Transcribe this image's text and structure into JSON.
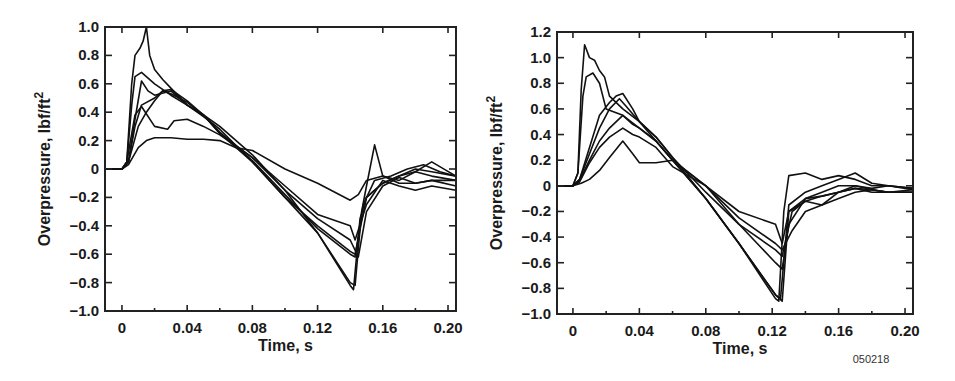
{
  "figure_id": "050218",
  "chart_data": [
    {
      "type": "line",
      "title": "",
      "xlabel": "Time, s",
      "ylabel": "Overpressure, lbf/ft",
      "ylabel_superscript": "2",
      "xlim": [
        -0.0104,
        0.2049
      ],
      "ylim": [
        -1.0,
        1.0
      ],
      "xticks": [
        0,
        0.04,
        0.08,
        0.12,
        0.16,
        0.2
      ],
      "xtick_labels": [
        "0",
        "0.04",
        "0.08",
        "0.12",
        "0.16",
        "0.20"
      ],
      "yticks": [
        -1.0,
        -0.8,
        -0.6,
        -0.4,
        -0.2,
        0,
        0.2,
        0.4,
        0.6,
        0.8,
        1.0
      ],
      "ytick_labels": [
        "−1.0",
        "−0.8",
        "−0.6",
        "−0.4",
        "−0.2",
        "0",
        "0.2",
        "0.4",
        "0.6",
        "0.8",
        "1.0"
      ],
      "grid": false,
      "legend": null,
      "color": "#111111",
      "series": [
        {
          "name": "trace-1",
          "x": [
            -0.0104,
            0.0,
            0.003,
            0.006,
            0.008,
            0.011,
            0.013,
            0.015,
            0.017,
            0.02,
            0.025,
            0.03,
            0.04,
            0.05,
            0.06,
            0.08,
            0.1,
            0.12,
            0.14,
            0.142,
            0.146,
            0.15,
            0.16,
            0.17,
            0.18,
            0.19,
            0.2049
          ],
          "y": [
            0,
            0,
            0.05,
            0.6,
            0.8,
            0.85,
            0.9,
            1.0,
            0.8,
            0.7,
            0.63,
            0.57,
            0.45,
            0.37,
            0.28,
            0.05,
            -0.2,
            -0.45,
            -0.82,
            -0.85,
            -0.35,
            -0.2,
            -0.1,
            -0.05,
            0.0,
            -0.02,
            -0.05
          ]
        },
        {
          "name": "trace-2",
          "x": [
            -0.0104,
            0.0,
            0.003,
            0.006,
            0.008,
            0.012,
            0.02,
            0.03,
            0.04,
            0.05,
            0.06,
            0.08,
            0.1,
            0.12,
            0.14,
            0.143,
            0.147,
            0.15,
            0.155,
            0.16,
            0.17,
            0.18,
            0.19,
            0.2049
          ],
          "y": [
            0,
            0,
            0.05,
            0.45,
            0.65,
            0.68,
            0.6,
            0.52,
            0.45,
            0.38,
            0.3,
            0.1,
            -0.15,
            -0.45,
            -0.8,
            -0.82,
            -0.3,
            -0.12,
            0.17,
            -0.05,
            -0.08,
            -0.02,
            0.05,
            -0.05
          ]
        },
        {
          "name": "trace-3",
          "x": [
            -0.0104,
            0.0,
            0.004,
            0.008,
            0.012,
            0.016,
            0.02,
            0.03,
            0.04,
            0.05,
            0.06,
            0.08,
            0.1,
            0.12,
            0.14,
            0.143,
            0.148,
            0.155,
            0.165,
            0.175,
            0.185,
            0.195,
            0.2049
          ],
          "y": [
            0,
            0,
            0.05,
            0.35,
            0.62,
            0.55,
            0.52,
            0.55,
            0.45,
            0.38,
            0.26,
            0.06,
            -0.18,
            -0.42,
            -0.6,
            -0.62,
            -0.25,
            -0.08,
            -0.05,
            0.0,
            0.03,
            -0.02,
            -0.05
          ]
        },
        {
          "name": "trace-4",
          "x": [
            -0.0104,
            0.0,
            0.004,
            0.008,
            0.012,
            0.02,
            0.025,
            0.03,
            0.04,
            0.05,
            0.06,
            0.08,
            0.1,
            0.12,
            0.14,
            0.143,
            0.15,
            0.16,
            0.17,
            0.18,
            0.19,
            0.2049
          ],
          "y": [
            0,
            0,
            0.05,
            0.3,
            0.45,
            0.5,
            0.55,
            0.53,
            0.47,
            0.38,
            0.25,
            0.05,
            -0.2,
            -0.4,
            -0.58,
            -0.6,
            -0.2,
            -0.1,
            -0.05,
            -0.02,
            -0.05,
            -0.08
          ]
        },
        {
          "name": "trace-5",
          "x": [
            -0.0104,
            0.0,
            0.004,
            0.01,
            0.015,
            0.02,
            0.025,
            0.03,
            0.04,
            0.05,
            0.06,
            0.08,
            0.1,
            0.12,
            0.14,
            0.145,
            0.15,
            0.16,
            0.17,
            0.18,
            0.19,
            0.2049
          ],
          "y": [
            0,
            0,
            0.05,
            0.3,
            0.4,
            0.48,
            0.55,
            0.56,
            0.48,
            0.38,
            0.25,
            0.08,
            -0.15,
            -0.35,
            -0.5,
            -0.62,
            -0.3,
            -0.12,
            -0.06,
            -0.1,
            -0.08,
            -0.12
          ]
        },
        {
          "name": "trace-6",
          "x": [
            -0.0104,
            0.0,
            0.003,
            0.008,
            0.012,
            0.02,
            0.028,
            0.032,
            0.04,
            0.05,
            0.06,
            0.08,
            0.1,
            0.12,
            0.14,
            0.143,
            0.15,
            0.16,
            0.17,
            0.18,
            0.19,
            0.2049
          ],
          "y": [
            0,
            0,
            0.05,
            0.38,
            0.44,
            0.3,
            0.28,
            0.34,
            0.35,
            0.3,
            0.24,
            0.08,
            -0.12,
            -0.32,
            -0.4,
            -0.5,
            -0.25,
            -0.08,
            -0.12,
            -0.15,
            -0.12,
            -0.15
          ]
        },
        {
          "name": "trace-7",
          "x": [
            -0.0104,
            0.0,
            0.004,
            0.01,
            0.015,
            0.02,
            0.03,
            0.04,
            0.05,
            0.06,
            0.07,
            0.08,
            0.1,
            0.12,
            0.14,
            0.145,
            0.15,
            0.16,
            0.17,
            0.18,
            0.19,
            0.2049
          ],
          "y": [
            0,
            0,
            0.03,
            0.15,
            0.2,
            0.22,
            0.22,
            0.21,
            0.21,
            0.2,
            0.15,
            0.13,
            0.0,
            -0.1,
            -0.22,
            -0.18,
            -0.08,
            -0.05,
            -0.1,
            -0.1,
            -0.08,
            -0.08
          ]
        }
      ]
    },
    {
      "type": "line",
      "title": "",
      "xlabel": "Time, s",
      "ylabel": "Overpressure, lbf/ft",
      "ylabel_superscript": "2",
      "xlim": [
        -0.0096,
        0.2048
      ],
      "ylim": [
        -1.0,
        1.2
      ],
      "xticks": [
        0,
        0.04,
        0.08,
        0.12,
        0.16,
        0.2
      ],
      "xtick_labels": [
        "0",
        "0.04",
        "0.08",
        "0.12",
        "0.16",
        "0.20"
      ],
      "yticks": [
        -1.0,
        -0.8,
        -0.6,
        -0.4,
        -0.2,
        0,
        0.2,
        0.4,
        0.6,
        0.8,
        1.0,
        1.2
      ],
      "ytick_labels": [
        "−1.0",
        "−0.8",
        "−0.6",
        "−0.4",
        "−0.2",
        "0",
        "0.2",
        "0.4",
        "0.6",
        "0.8",
        "1.0",
        "1.2"
      ],
      "grid": false,
      "legend": null,
      "color": "#111111",
      "series": [
        {
          "name": "trace-1",
          "x": [
            -0.0096,
            0.0,
            0.003,
            0.005,
            0.007,
            0.01,
            0.013,
            0.016,
            0.019,
            0.022,
            0.03,
            0.04,
            0.05,
            0.06,
            0.08,
            0.1,
            0.122,
            0.124,
            0.127,
            0.13,
            0.14,
            0.15,
            0.16,
            0.17,
            0.18,
            0.19,
            0.2048
          ],
          "y": [
            0,
            0,
            0.1,
            0.75,
            1.1,
            1.0,
            0.98,
            0.9,
            0.85,
            0.7,
            0.6,
            0.5,
            0.35,
            0.2,
            -0.1,
            -0.45,
            -0.88,
            -0.9,
            -0.2,
            0.08,
            0.1,
            0.05,
            0.08,
            0.05,
            0.0,
            0.0,
            -0.02
          ]
        },
        {
          "name": "trace-2",
          "x": [
            -0.0096,
            0.0,
            0.003,
            0.006,
            0.008,
            0.012,
            0.016,
            0.02,
            0.03,
            0.04,
            0.05,
            0.06,
            0.08,
            0.1,
            0.122,
            0.125,
            0.13,
            0.14,
            0.15,
            0.16,
            0.17,
            0.18,
            0.19,
            0.2048
          ],
          "y": [
            0,
            0,
            0.1,
            0.7,
            0.85,
            0.88,
            0.8,
            0.6,
            0.55,
            0.45,
            0.35,
            0.2,
            -0.1,
            -0.45,
            -0.85,
            -0.88,
            -0.15,
            -0.05,
            0.0,
            0.05,
            0.1,
            0.02,
            0.0,
            -0.02
          ]
        },
        {
          "name": "trace-3",
          "x": [
            -0.0096,
            0.0,
            0.004,
            0.01,
            0.016,
            0.022,
            0.026,
            0.03,
            0.036,
            0.04,
            0.05,
            0.06,
            0.08,
            0.1,
            0.122,
            0.126,
            0.13,
            0.14,
            0.15,
            0.16,
            0.17,
            0.18,
            0.19,
            0.2048
          ],
          "y": [
            0,
            0,
            0.05,
            0.3,
            0.55,
            0.65,
            0.7,
            0.72,
            0.6,
            0.5,
            0.38,
            0.22,
            -0.1,
            -0.45,
            -0.85,
            -0.9,
            -0.2,
            -0.1,
            -0.05,
            0.0,
            0.0,
            -0.02,
            0.0,
            -0.03
          ]
        },
        {
          "name": "trace-4",
          "x": [
            -0.0096,
            0.0,
            0.004,
            0.01,
            0.016,
            0.022,
            0.028,
            0.032,
            0.04,
            0.05,
            0.06,
            0.08,
            0.1,
            0.122,
            0.126,
            0.13,
            0.14,
            0.15,
            0.16,
            0.17,
            0.18,
            0.19,
            0.2048
          ],
          "y": [
            0,
            0,
            0.05,
            0.25,
            0.45,
            0.6,
            0.68,
            0.62,
            0.5,
            0.38,
            0.22,
            -0.05,
            -0.3,
            -0.6,
            -0.65,
            -0.3,
            -0.1,
            -0.08,
            -0.05,
            -0.02,
            -0.03,
            -0.05,
            -0.05
          ]
        },
        {
          "name": "trace-5",
          "x": [
            -0.0096,
            0.0,
            0.004,
            0.01,
            0.016,
            0.022,
            0.03,
            0.036,
            0.04,
            0.05,
            0.06,
            0.08,
            0.1,
            0.122,
            0.126,
            0.132,
            0.14,
            0.15,
            0.16,
            0.17,
            0.18,
            0.19,
            0.2048
          ],
          "y": [
            0,
            0,
            0.04,
            0.2,
            0.35,
            0.45,
            0.55,
            0.48,
            0.45,
            0.35,
            0.2,
            0.0,
            -0.3,
            -0.5,
            -0.55,
            -0.2,
            -0.12,
            -0.08,
            -0.05,
            -0.02,
            -0.05,
            -0.05,
            -0.03
          ]
        },
        {
          "name": "trace-6",
          "x": [
            -0.0096,
            0.0,
            0.004,
            0.01,
            0.016,
            0.022,
            0.03,
            0.036,
            0.04,
            0.05,
            0.06,
            0.08,
            0.1,
            0.122,
            0.126,
            0.132,
            0.14,
            0.15,
            0.16,
            0.17,
            0.18,
            0.19,
            0.2048
          ],
          "y": [
            0,
            0,
            0.03,
            0.18,
            0.3,
            0.38,
            0.45,
            0.4,
            0.38,
            0.3,
            0.15,
            0.0,
            -0.25,
            -0.45,
            -0.5,
            -0.35,
            -0.2,
            -0.15,
            -0.05,
            0.0,
            -0.03,
            -0.05,
            -0.05
          ]
        },
        {
          "name": "trace-7",
          "x": [
            -0.0096,
            0.0,
            0.005,
            0.01,
            0.016,
            0.022,
            0.03,
            0.036,
            0.04,
            0.05,
            0.06,
            0.08,
            0.1,
            0.122,
            0.126,
            0.13,
            0.14,
            0.15,
            0.16,
            0.17,
            0.18,
            0.19,
            0.2048
          ],
          "y": [
            0,
            0,
            0.02,
            0.05,
            0.12,
            0.22,
            0.35,
            0.25,
            0.18,
            0.18,
            0.2,
            0.0,
            -0.2,
            -0.3,
            -0.45,
            -0.2,
            -0.12,
            -0.15,
            -0.1,
            -0.05,
            -0.03,
            -0.05,
            -0.05
          ]
        }
      ]
    }
  ]
}
